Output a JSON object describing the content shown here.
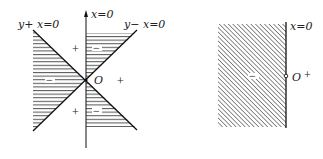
{
  "left_figure": {
    "axis_label": "x=0",
    "line1_label": "y+ x=0",
    "line2_label": "y− x=0",
    "origin_label": "O",
    "signs": {
      "top": "+",
      "right": "+",
      "bottom": "+",
      "top_shaded": "−",
      "left_shaded": "−",
      "bottom_shaded": "−"
    }
  },
  "right_figure": {
    "axis_label": "x=0",
    "origin_label": "O",
    "sign_right": "+",
    "sign_shaded": "−"
  },
  "colors": {
    "line": "#111111",
    "hatch": "#333333",
    "background": "#ffffff"
  }
}
